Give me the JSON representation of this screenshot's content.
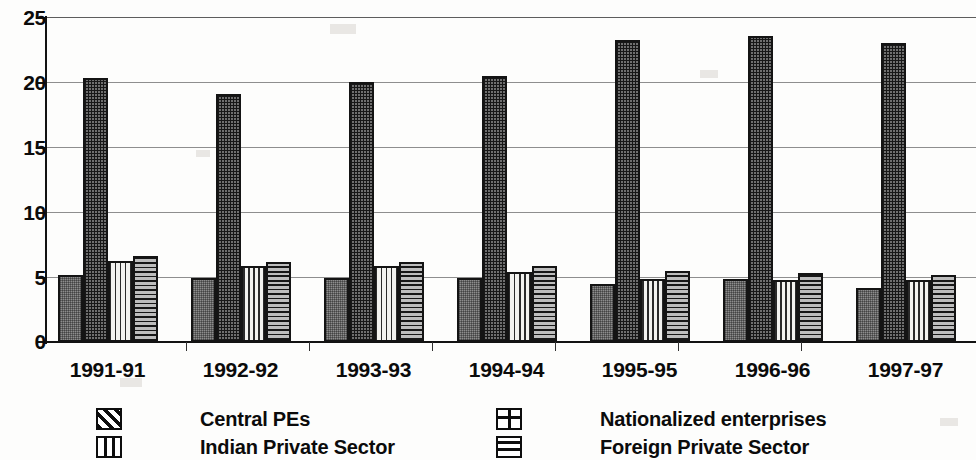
{
  "chart_data": {
    "type": "bar",
    "title": "",
    "subtitle": "",
    "xlabel": "",
    "ylabel": "",
    "ylim": [
      0,
      25
    ],
    "yticks": [
      0,
      5,
      10,
      15,
      20,
      25
    ],
    "ytick_labels": [
      "0",
      "5",
      "10",
      "15",
      "20",
      "25"
    ],
    "grid": true,
    "grid_axis": "y",
    "legend_position": "bottom",
    "legend_columns": 2,
    "orientation": "vertical",
    "grouping": "clustered",
    "colors": {
      "central_pes": "#8d8d8d",
      "nationalized_enterprises": "#6f6f6f",
      "indian_private_sector": "#f2f2ef",
      "foreign_private_sector": "#bdbdbd",
      "axis": "#121212",
      "gridline": "#8e8e8e",
      "text": "#0b0b0b",
      "background": "#fdfdfc"
    },
    "patterns": {
      "central_pes": "diagonal-hatch",
      "nationalized_enterprises": "cross-hatch-grid",
      "indian_private_sector": "vertical-lines",
      "foreign_private_sector": "horizontal-lines"
    },
    "categories": [
      "1991-91",
      "1992-92",
      "1993-93",
      "1994-94",
      "1995-95",
      "1996-96",
      "1997-97"
    ],
    "series": [
      {
        "name": "Central PEs",
        "pattern": "diagonal-hatch",
        "values": [
          5.2,
          4.95,
          4.95,
          4.95,
          4.5,
          4.85,
          4.2
        ]
      },
      {
        "name": "Nationalized enterprises",
        "pattern": "cross-hatch-grid",
        "values": [
          20.4,
          19.1,
          20.1,
          20.5,
          23.3,
          23.6,
          23.1
        ]
      },
      {
        "name": "Indian Private Sector",
        "pattern": "vertical-lines",
        "values": [
          6.25,
          5.85,
          5.85,
          5.4,
          4.85,
          4.75,
          4.8
        ]
      },
      {
        "name": "Foreign Private Sector",
        "pattern": "horizontal-lines",
        "values": [
          6.6,
          6.15,
          6.15,
          5.85,
          5.45,
          5.3,
          5.15
        ]
      }
    ]
  },
  "legend": {
    "items": [
      {
        "label": "Central PEs",
        "swatch": "diagonal-hatch-icon"
      },
      {
        "label": "Nationalized enterprises",
        "swatch": "cross-hatch-icon"
      },
      {
        "label": "Indian Private Sector",
        "swatch": "vertical-lines-icon"
      },
      {
        "label": "Foreign Private Sector",
        "swatch": "horizontal-lines-icon"
      }
    ]
  }
}
